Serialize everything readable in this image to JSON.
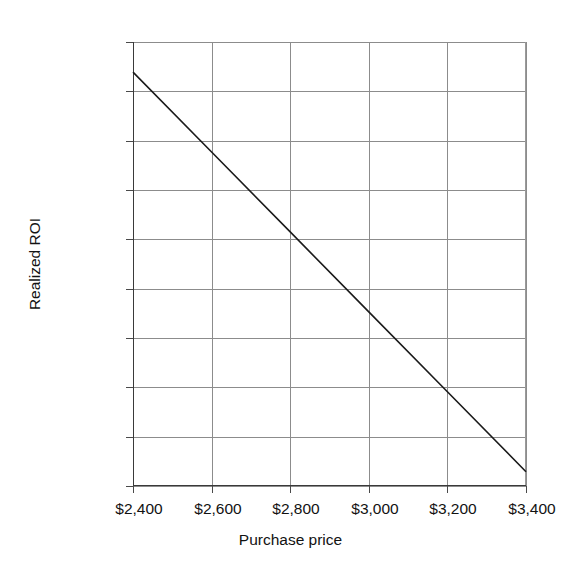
{
  "chart_data": {
    "type": "line",
    "title": "",
    "subtitle": "",
    "xlabel": "Purchase price",
    "ylabel": "Realized ROI",
    "grid": true,
    "legend": "none",
    "xlim": [
      2400,
      3400
    ],
    "ylim": [
      0,
      180
    ],
    "x_tick_labels": [
      "$2,400",
      "$2,600",
      "$2,800",
      "$3,000",
      "$3,200",
      "$3,400"
    ],
    "x_tick_values": [
      2400,
      2600,
      2800,
      3000,
      3200,
      3400
    ],
    "y_tick_labels": [
      "0.0%",
      "20.0%",
      "40.0%",
      "60.0%",
      "80.0%",
      "100.0%",
      "120.0%",
      "140.0%",
      "160.0%",
      "180.0%"
    ],
    "y_tick_values": [
      0,
      20,
      40,
      60,
      80,
      100,
      120,
      140,
      160,
      180
    ],
    "series": [
      {
        "name": "Realized ROI",
        "color": "#1a1a1a",
        "x": [
          2400,
          2600,
          2800,
          3000,
          3200,
          3400
        ],
        "values": [
          167.8,
          135.4,
          103.0,
          70.6,
          38.2,
          5.8
        ]
      }
    ],
    "annotations": []
  },
  "style": {
    "background": "#ffffff",
    "gridline_color": "#8c8c8c",
    "axis_color": "#3a3a3a",
    "text_color": "#121212",
    "series_color": "#1a1a1a"
  },
  "geometry": {
    "plot_left": 133,
    "plot_top": 42,
    "plot_width": 393,
    "plot_height": 444
  }
}
